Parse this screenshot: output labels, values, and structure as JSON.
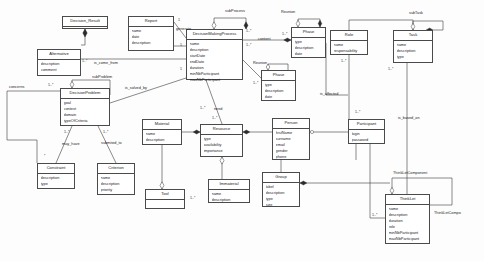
{
  "diagram": {
    "type": "uml-class-diagram",
    "stroke_color": "#4a4a4a",
    "background_color": "#fdfdfd",
    "classes": [
      {
        "id": "decision_result",
        "name": "Decision_Result",
        "attributes": [],
        "x": 62,
        "y": 16,
        "w": 46,
        "h": 13
      },
      {
        "id": "report",
        "name": "Report",
        "attributes": [
          "name",
          "date",
          "description"
        ],
        "x": 128,
        "y": 16,
        "w": 46,
        "h": 35
      },
      {
        "id": "alternative",
        "name": "Alternative",
        "attributes": [
          "description",
          "comment"
        ],
        "x": 37,
        "y": 49,
        "w": 44,
        "h": 27
      },
      {
        "id": "decision_making_process",
        "name": "DecisionMakingProcess",
        "attributes": [
          "name",
          "description",
          "startDate",
          "endDate",
          "duration",
          "minNbParticipant",
          "maxNbParticipant"
        ],
        "x": 186,
        "y": 29,
        "w": 57,
        "h": 51
      },
      {
        "id": "phase_top",
        "name": "Phase",
        "attributes": [
          "type",
          "description",
          "date"
        ],
        "x": 291,
        "y": 27,
        "w": 35,
        "h": 31
      },
      {
        "id": "phase_bottom",
        "name": "Phase",
        "attributes": [
          "type",
          "description",
          "date"
        ],
        "x": 261,
        "y": 70,
        "w": 35,
        "h": 31
      },
      {
        "id": "role",
        "name": "Role",
        "attributes": [
          "name",
          "responsability"
        ],
        "x": 330,
        "y": 30,
        "w": 38,
        "h": 25
      },
      {
        "id": "task",
        "name": "Task",
        "attributes": [
          "name",
          "description",
          "type"
        ],
        "x": 393,
        "y": 30,
        "w": 40,
        "h": 33
      },
      {
        "id": "decision_problem",
        "name": "DecisionProblem",
        "attributes": [
          "goal",
          "context",
          "domain",
          "typeOfCriteria"
        ],
        "x": 60,
        "y": 88,
        "w": 50,
        "h": 38
      },
      {
        "id": "constraint",
        "name": "Constraint",
        "attributes": [
          "description",
          "type"
        ],
        "x": 37,
        "y": 163,
        "w": 38,
        "h": 26
      },
      {
        "id": "criterion",
        "name": "Criterion",
        "attributes": [
          "name",
          "description",
          "priority"
        ],
        "x": 97,
        "y": 163,
        "w": 38,
        "h": 32
      },
      {
        "id": "material",
        "name": "Material",
        "attributes": [
          "name",
          "description"
        ],
        "x": 142,
        "y": 119,
        "w": 40,
        "h": 26
      },
      {
        "id": "tool",
        "name": "Tool",
        "attributes": [],
        "x": 145,
        "y": 189,
        "w": 40,
        "h": 20
      },
      {
        "id": "resource",
        "name": "Resource",
        "attributes": [
          "type",
          "availability",
          "importance"
        ],
        "x": 200,
        "y": 124,
        "w": 43,
        "h": 33
      },
      {
        "id": "immaterial",
        "name": "Immaterial",
        "attributes": [
          "name",
          "description"
        ],
        "x": 208,
        "y": 179,
        "w": 42,
        "h": 24
      },
      {
        "id": "person",
        "name": "Person",
        "attributes": [
          "firstName",
          "surname",
          "email",
          "gender",
          "phone"
        ],
        "x": 272,
        "y": 118,
        "w": 38,
        "h": 42
      },
      {
        "id": "group",
        "name": "Group",
        "attributes": [
          "label",
          "description",
          "type",
          "size"
        ],
        "x": 262,
        "y": 172,
        "w": 38,
        "h": 35
      },
      {
        "id": "participant",
        "name": "Participant",
        "attributes": [
          "login",
          "password"
        ],
        "x": 348,
        "y": 119,
        "w": 37,
        "h": 25
      },
      {
        "id": "thinklet",
        "name": "ThinkLet",
        "attributes": [
          "name",
          "description",
          "duration",
          "role",
          "minNbParticipant",
          "maxNbParticipant"
        ],
        "x": 385,
        "y": 194,
        "w": 45,
        "h": 50
      }
    ],
    "edge_labels": [
      {
        "id": "generate",
        "text": "generate",
        "x": 176,
        "y": 28
      },
      {
        "id": "sub_process",
        "text": "subProcess",
        "x": 225,
        "y": 10
      },
      {
        "id": "reunion_top",
        "text": "Reunion",
        "x": 281,
        "y": 11
      },
      {
        "id": "reunion_bottom",
        "text": "Reunion",
        "x": 253,
        "y": 62
      },
      {
        "id": "content",
        "text": "content",
        "x": 258,
        "y": 38
      },
      {
        "id": "sub_task",
        "text": "subTask",
        "x": 409,
        "y": 12
      },
      {
        "id": "is_come_from",
        "text": "is_come_from",
        "x": 94,
        "y": 62
      },
      {
        "id": "sub_problem",
        "text": "subProblem",
        "x": 92,
        "y": 76
      },
      {
        "id": "is_solved_by",
        "text": "is_solved_by",
        "x": 125,
        "y": 87
      },
      {
        "id": "concerns",
        "text": "concerns",
        "x": 9,
        "y": 86
      },
      {
        "id": "may_have",
        "text": "may_have",
        "x": 62,
        "y": 143
      },
      {
        "id": "submited_to",
        "text": "submited_to",
        "x": 101,
        "y": 142
      },
      {
        "id": "need",
        "text": "need",
        "x": 214,
        "y": 108
      },
      {
        "id": "is_affected",
        "text": "is_affected",
        "x": 320,
        "y": 93
      },
      {
        "id": "is_based_on",
        "text": "is_based_on",
        "x": 398,
        "y": 117
      },
      {
        "id": "thinklet_component",
        "text": "ThinkLetComponent",
        "x": 393,
        "y": 172
      },
      {
        "id": "thinklet_compo",
        "text": "ThinkLetCompo",
        "x": 434,
        "y": 212
      }
    ],
    "multiplicities": [
      {
        "id": "m-report-1",
        "text": "1",
        "x": 178,
        "y": 19
      },
      {
        "id": "m-dmp-1",
        "text": "1",
        "x": 180,
        "y": 44
      },
      {
        "id": "m-dmp-2",
        "text": "1",
        "x": 180,
        "y": 68
      },
      {
        "id": "m-alt-1n",
        "text": "1..*",
        "x": 82,
        "y": 60
      },
      {
        "id": "m-dmp-sub1",
        "text": "1..*",
        "x": 246,
        "y": 30
      },
      {
        "id": "m-dmp-sub2",
        "text": "1..*",
        "x": 246,
        "y": 44
      },
      {
        "id": "m-dmp-need",
        "text": "1..*",
        "x": 200,
        "y": 107
      },
      {
        "id": "m-phase-1n",
        "text": "1..*",
        "x": 282,
        "y": 33
      },
      {
        "id": "m-phase-b",
        "text": "1..*",
        "x": 253,
        "y": 82
      },
      {
        "id": "m-role-1n",
        "text": "1..*",
        "x": 341,
        "y": 60
      },
      {
        "id": "m-task-1n",
        "text": "1..*",
        "x": 388,
        "y": 68
      },
      {
        "id": "m-dp-1n",
        "text": "1..*",
        "x": 48,
        "y": 84
      },
      {
        "id": "m-dp-con",
        "text": "1..*",
        "x": 64,
        "y": 131
      },
      {
        "id": "m-dp-cri",
        "text": "1..*",
        "x": 103,
        "y": 131
      },
      {
        "id": "m-con-s",
        "text": "*",
        "x": 44,
        "y": 155
      },
      {
        "id": "m-res-1n",
        "text": "1..*",
        "x": 212,
        "y": 117
      },
      {
        "id": "m-tool-1n",
        "text": "1..*",
        "x": 190,
        "y": 197
      },
      {
        "id": "m-part-1n",
        "text": "1..*",
        "x": 355,
        "y": 111
      },
      {
        "id": "m-thinklet-1n",
        "text": "1..*",
        "x": 372,
        "y": 214
      }
    ]
  }
}
